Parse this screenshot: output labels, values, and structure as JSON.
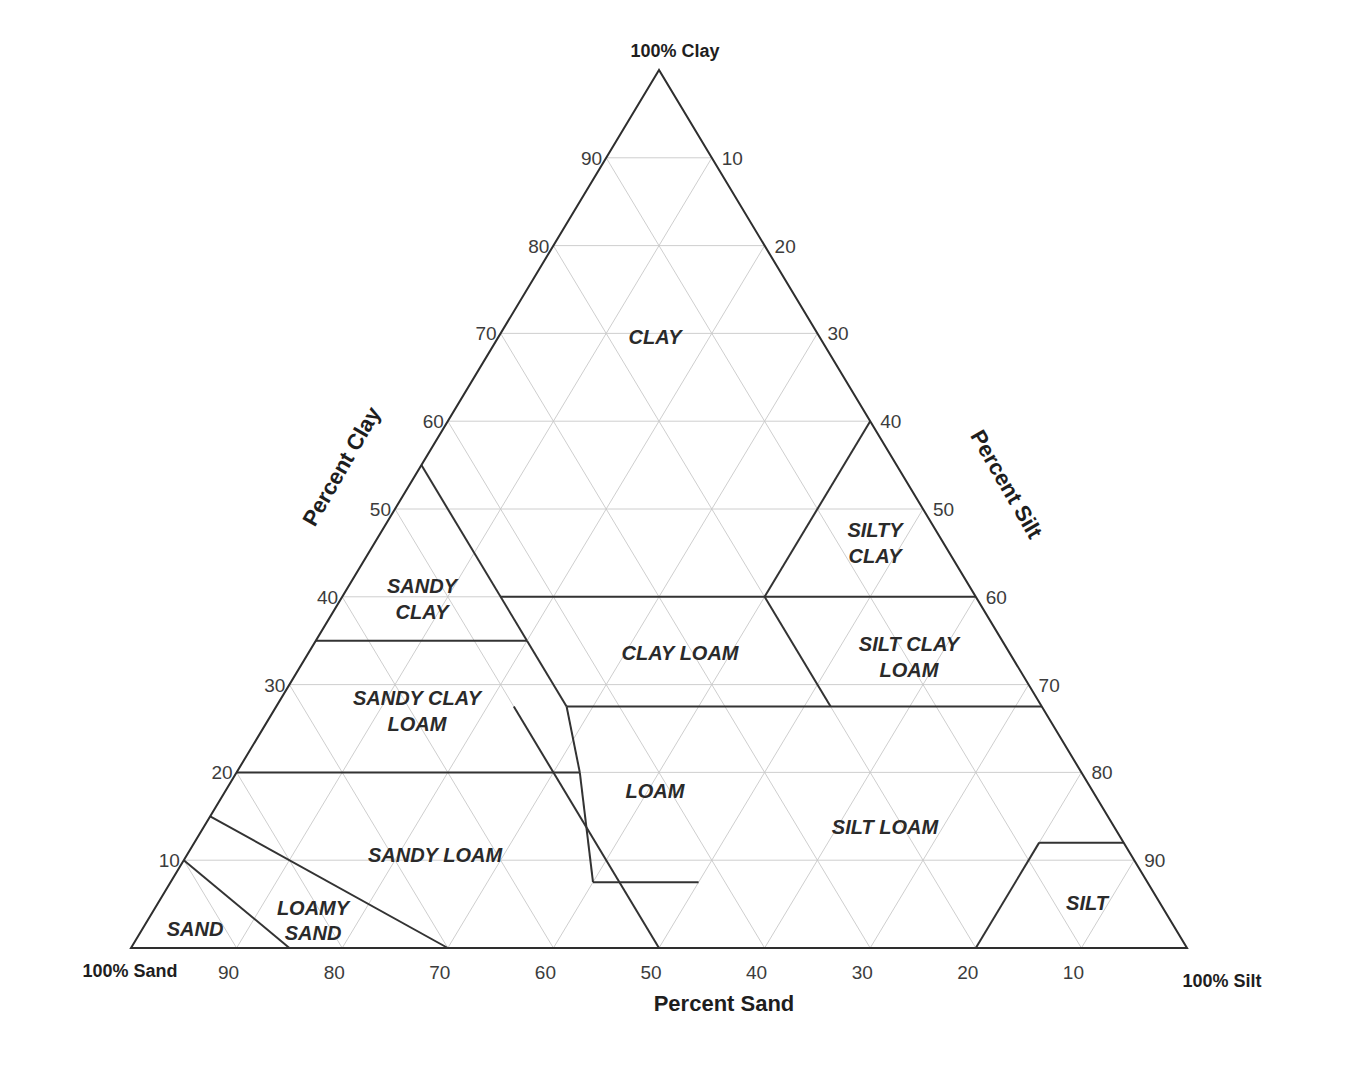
{
  "corners": {
    "clay": "100% Clay",
    "sand": "100% Sand",
    "silt": "100% Silt"
  },
  "axes": {
    "clay": {
      "title": "Percent Clay",
      "ticks": [
        "10",
        "20",
        "30",
        "40",
        "50",
        "60",
        "70",
        "80",
        "90"
      ]
    },
    "silt": {
      "title": "Percent Silt",
      "ticks": [
        "10",
        "20",
        "30",
        "40",
        "50",
        "60",
        "70",
        "80",
        "90"
      ]
    },
    "sand": {
      "title": "Percent Sand",
      "ticks": [
        "90",
        "80",
        "70",
        "60",
        "50",
        "40",
        "30",
        "20",
        "10"
      ]
    }
  },
  "colors": {
    "background": "#ffffff",
    "grid": "#c8c8c8",
    "outline": "#2e2e2e",
    "boundary": "#333333",
    "label": "#2a2a2a"
  },
  "regions": [
    {
      "name": "CLAY",
      "lines": [
        "CLAY"
      ]
    },
    {
      "name": "SILTY CLAY",
      "lines": [
        "SILTY",
        "CLAY"
      ]
    },
    {
      "name": "SANDY CLAY",
      "lines": [
        "SANDY",
        "CLAY"
      ]
    },
    {
      "name": "CLAY LOAM",
      "lines": [
        "CLAY LOAM"
      ]
    },
    {
      "name": "SILT CLAY LOAM",
      "lines": [
        "SILT CLAY",
        "LOAM"
      ]
    },
    {
      "name": "SANDY CLAY LOAM",
      "lines": [
        "SANDY CLAY",
        "LOAM"
      ]
    },
    {
      "name": "LOAM",
      "lines": [
        "LOAM"
      ]
    },
    {
      "name": "SILT LOAM",
      "lines": [
        "SILT LOAM"
      ]
    },
    {
      "name": "SANDY LOAM",
      "lines": [
        "SANDY LOAM"
      ]
    },
    {
      "name": "LOAMY SAND",
      "lines": [
        "LOAMY",
        "SAND"
      ]
    },
    {
      "name": "SAND",
      "lines": [
        "SAND"
      ]
    },
    {
      "name": "SILT",
      "lines": [
        "SILT"
      ]
    }
  ],
  "chart_data": {
    "type": "ternary",
    "axes": [
      "Percent Clay",
      "Percent Silt",
      "Percent Sand"
    ],
    "corners": [
      "100% Clay",
      "100% Sand",
      "100% Silt"
    ],
    "grid_step": 10,
    "boundaries_clay_silt_pct": [
      {
        "from": [
          55,
          0
        ],
        "to": [
          35,
          20
        ]
      },
      {
        "from": [
          35,
          20
        ],
        "to": [
          27.5,
          27.5
        ]
      },
      {
        "from": [
          35,
          0
        ],
        "to": [
          35,
          20
        ]
      },
      {
        "from": [
          40,
          15
        ],
        "to": [
          40,
          60
        ]
      },
      {
        "from": [
          40,
          40
        ],
        "to": [
          60,
          40
        ]
      },
      {
        "from": [
          40,
          40
        ],
        "to": [
          27.5,
          52.5
        ]
      },
      {
        "from": [
          27.5,
          27.5
        ],
        "to": [
          27.5,
          72.5
        ]
      },
      {
        "from": [
          20,
          0
        ],
        "to": [
          20,
          32.5
        ]
      },
      {
        "from": [
          20,
          32.5
        ],
        "to": [
          27.5,
          27.5
        ]
      },
      {
        "from": [
          20,
          32.5
        ],
        "to": [
          7.5,
          40
        ]
      },
      {
        "from": [
          7.5,
          40
        ],
        "to": [
          7.5,
          50
        ]
      },
      {
        "from": [
          27.5,
          22.5
        ],
        "to": [
          0,
          50
        ]
      },
      {
        "from": [
          12,
          80
        ],
        "to": [
          12,
          88
        ]
      },
      {
        "from": [
          12,
          80
        ],
        "to": [
          0,
          80
        ]
      },
      {
        "from": [
          15,
          0
        ],
        "to": [
          0,
          30
        ]
      },
      {
        "from": [
          10,
          0
        ],
        "to": [
          0,
          15
        ]
      }
    ],
    "regions": [
      "CLAY",
      "SILTY CLAY",
      "SANDY CLAY",
      "CLAY LOAM",
      "SILT CLAY LOAM",
      "SANDY CLAY LOAM",
      "LOAM",
      "SILT LOAM",
      "SANDY LOAM",
      "LOAMY SAND",
      "SAND",
      "SILT"
    ]
  }
}
